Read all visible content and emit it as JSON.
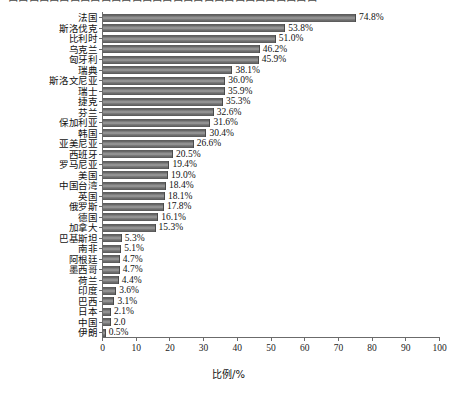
{
  "top_clipped_text": "口口口口口口口口口口口口口口口口口口口口口口口口口口口口口口",
  "axis": {
    "x_label": "比例/%",
    "x_ticks": [
      "0",
      "10",
      "20",
      "30",
      "40",
      "50",
      "60",
      "70",
      "80",
      "90",
      "100"
    ],
    "x_min": 0,
    "x_max": 100
  },
  "style": {
    "bar_color": "#7d7d7d",
    "axis_color": "#6b6b6b",
    "text_color": "#111111",
    "background": "#ffffff"
  },
  "chart_data": {
    "type": "bar",
    "orientation": "horizontal",
    "title": "",
    "subtitle": "",
    "xlabel": "比例/%",
    "ylabel": "",
    "xlim": [
      0,
      100
    ],
    "grid": false,
    "legend": "none",
    "categories": [
      "法国",
      "斯洛伐克",
      "比利时",
      "乌克兰",
      "匈牙利",
      "瑞典",
      "斯洛文尼亚",
      "瑞士",
      "捷克",
      "芬兰",
      "保加利亚",
      "韩国",
      "亚美尼亚",
      "西班牙",
      "罗马尼亚",
      "美国",
      "中国台湾",
      "英国",
      "俄罗斯",
      "德国",
      "加拿大",
      "巴基斯坦",
      "南非",
      "阿根廷",
      "墨西哥",
      "荷兰",
      "印度",
      "巴西",
      "日本",
      "中国",
      "伊朗"
    ],
    "values": [
      74.8,
      53.8,
      51.0,
      46.2,
      45.9,
      38.1,
      36.0,
      35.9,
      35.3,
      32.6,
      31.6,
      30.4,
      26.6,
      20.5,
      19.4,
      19.0,
      18.4,
      18.1,
      17.8,
      16.1,
      15.3,
      5.3,
      5.1,
      4.7,
      4.7,
      4.4,
      3.6,
      3.1,
      2.1,
      2.0,
      0.5
    ],
    "value_labels": [
      "74.8%",
      "53.8%",
      "51.0%",
      "46.2%",
      "45.9%",
      "38.1%",
      "36.0%",
      "35.9%",
      "35.3%",
      "32.6%",
      "31.6%",
      "30.4%",
      "26.6%",
      "20.5%",
      "19.4%",
      "19.0%",
      "18.4%",
      "18.1%",
      "17.8%",
      "16.1%",
      "15.3%",
      "5.3%",
      "5.1%",
      "4.7%",
      "4.7%",
      "4.4%",
      "3.6%",
      "3.1%",
      "2.1%",
      "2.0",
      "0.5%"
    ]
  }
}
